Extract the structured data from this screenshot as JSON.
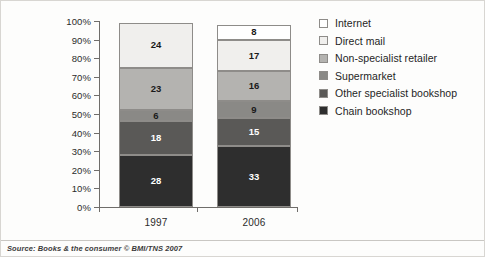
{
  "source_note": "Source: Books & the consumer © BMI/TNS 2007",
  "legend": {
    "items": [
      {
        "label": "Internet",
        "color": "#ffffff"
      },
      {
        "label": "Direct mail",
        "color": "#f0efed"
      },
      {
        "label": "Non-specialist retailer",
        "color": "#b4b3b0"
      },
      {
        "label": "Supermarket",
        "color": "#8a8986"
      },
      {
        "label": "Other specialist bookshop",
        "color": "#5a5957"
      },
      {
        "label": "Chain bookshop",
        "color": "#2e2e2e"
      }
    ]
  },
  "chart_data": {
    "type": "bar",
    "stacked": true,
    "normalized_percent": true,
    "title": "",
    "xlabel": "",
    "ylabel": "",
    "categories": [
      "1997",
      "2006"
    ],
    "ylim": [
      0,
      100
    ],
    "ytick_labels": [
      "0%",
      "10%",
      "20%",
      "30%",
      "40%",
      "50%",
      "60%",
      "70%",
      "80%",
      "90%",
      "100%"
    ],
    "ytick_values": [
      0,
      10,
      20,
      30,
      40,
      50,
      60,
      70,
      80,
      90,
      100
    ],
    "grid": false,
    "legend_position": "right",
    "series": [
      {
        "name": "Chain bookshop",
        "color": "#2e2e2e",
        "label_color": "#ffffff",
        "values": [
          28,
          33
        ]
      },
      {
        "name": "Other specialist bookshop",
        "color": "#5a5957",
        "label_color": "#ffffff",
        "values": [
          18,
          15
        ]
      },
      {
        "name": "Supermarket",
        "color": "#8a8986",
        "label_color": "#1a1a1a",
        "values": [
          6,
          9
        ]
      },
      {
        "name": "Non-specialist retailer",
        "color": "#b4b3b0",
        "label_color": "#1a1a1a",
        "values": [
          23,
          16
        ]
      },
      {
        "name": "Direct mail",
        "color": "#f0efed",
        "label_color": "#1a1a1a",
        "values": [
          24,
          17
        ]
      },
      {
        "name": "Internet",
        "color": "#ffffff",
        "label_color": "#1a1a1a",
        "values": [
          null,
          8
        ]
      }
    ]
  }
}
